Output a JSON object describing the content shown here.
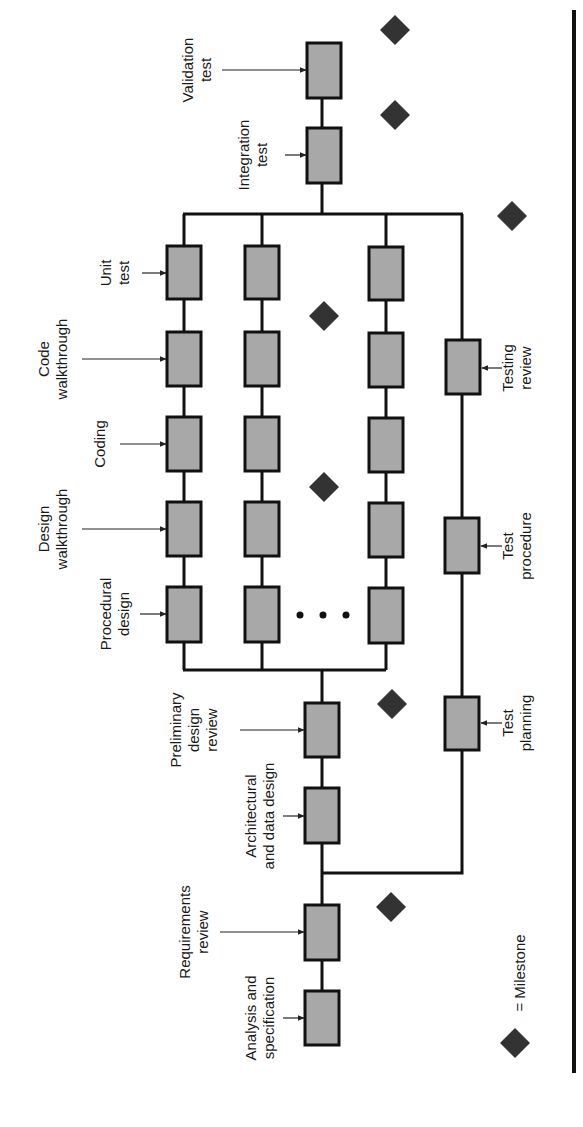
{
  "diagram": {
    "orientation": "rotated-90-ccw",
    "colors": {
      "box_fill": "#a8a8a8",
      "box_stroke": "#111111",
      "milestone": "#333333",
      "background": "#ffffff"
    },
    "main_spine": [
      {
        "id": "analysis",
        "label_line1": "Analysis and",
        "label_line2": "specification"
      },
      {
        "id": "requirements-review",
        "label_line1": "Requirements",
        "label_line2": "review"
      },
      {
        "id": "architectural",
        "label_line1": "Architectural",
        "label_line2": "and data design"
      },
      {
        "id": "preliminary-review",
        "label_line1": "Preliminary",
        "label_line2": "design",
        "label_line3": "review"
      }
    ],
    "module_stages": [
      {
        "id": "procedural-design",
        "label_line1": "Procedural",
        "label_line2": "design"
      },
      {
        "id": "design-walkthrough",
        "label_line1": "Design",
        "label_line2": "walkthrough"
      },
      {
        "id": "coding",
        "label_line1": "Coding"
      },
      {
        "id": "code-walkthrough",
        "label_line1": "Code",
        "label_line2": "walkthrough"
      },
      {
        "id": "unit-test",
        "label_line1": "Unit",
        "label_line2": "test"
      }
    ],
    "module_columns": 3,
    "ellipsis": "• • •",
    "test_track": [
      {
        "id": "test-planning",
        "label_line1": "Test",
        "label_line2": "planning"
      },
      {
        "id": "test-procedure",
        "label_line1": "Test",
        "label_line2": "procedure"
      },
      {
        "id": "testing-review",
        "label_line1": "Testing",
        "label_line2": "review"
      }
    ],
    "final_stages": [
      {
        "id": "integration-test",
        "label_line1": "Integration",
        "label_line2": "test"
      },
      {
        "id": "validation-test",
        "label_line1": "Validation",
        "label_line2": "test"
      }
    ],
    "milestone_count": 7,
    "legend": {
      "text": "= Milestone"
    }
  }
}
